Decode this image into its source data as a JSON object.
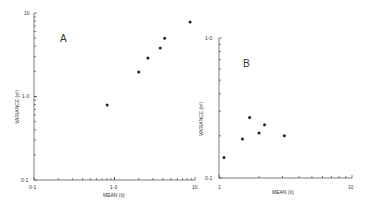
{
  "chart_data": [
    {
      "type": "scatter",
      "panel_label": "A",
      "xlabel": "MEAN (x̄)",
      "ylabel": "VARIANCE (s²)",
      "xscale": "log",
      "yscale": "log",
      "xlim": [
        0.1,
        10
      ],
      "ylim": [
        0.1,
        10
      ],
      "x_ticks": [
        "0·1",
        "1·0",
        "10"
      ],
      "y_ticks": [
        "0·1",
        "1·0",
        "10"
      ],
      "grid": false,
      "x": [
        0.81,
        2.0,
        2.6,
        3.7,
        4.2,
        8.7
      ],
      "y": [
        0.79,
        1.96,
        2.9,
        3.8,
        5.0,
        7.8
      ]
    },
    {
      "type": "scatter",
      "panel_label": "B",
      "xlabel": "MEAN (x̄)",
      "ylabel": "VARIANCE (s²)",
      "xscale": "log",
      "yscale": "log",
      "xlim": [
        1,
        10
      ],
      "ylim": [
        0.1,
        1.0
      ],
      "x_ticks": [
        "1",
        "10"
      ],
      "y_ticks": [
        "0·1",
        "1·0"
      ],
      "grid": false,
      "x": [
        1.09,
        1.5,
        1.7,
        2.0,
        2.2,
        3.1
      ],
      "y": [
        0.14,
        0.19,
        0.27,
        0.21,
        0.24,
        0.2
      ]
    }
  ],
  "labels": {
    "a_panel": "A",
    "b_panel": "B",
    "a_xlabel": "MEAN (x̄)",
    "a_ylabel": "VARIANCE (s²)",
    "b_xlabel": "MEAN (x̄)",
    "b_ylabel": "VARIANCE (s²)",
    "a_x0": "0·1",
    "a_x1": "1·0",
    "a_x2": "10",
    "a_y0": "0·1",
    "a_y1": "1·0",
    "a_y2": "10",
    "b_x0": "1",
    "b_x1": "10",
    "b_y0": "0·1",
    "b_y1": "1·0"
  }
}
